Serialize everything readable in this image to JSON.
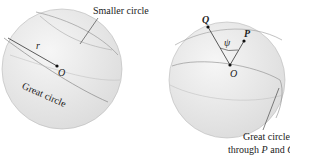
{
  "left_figure": {
    "smaller_circle_label": "Smaller circle",
    "radius_label": "r",
    "center_label": "O",
    "great_circle_label": "Great circle"
  },
  "right_figure": {
    "point_q_label": "Q",
    "point_p_label": "P",
    "angle_label": "ψ",
    "center_label": "O",
    "caption_line1": "Great circle",
    "caption_line2_prefix": "through ",
    "caption_p": "P",
    "caption_and": " and ",
    "caption_q": "Q"
  },
  "colors": {
    "sphere_fill": "#ececec",
    "line": "#444444"
  }
}
